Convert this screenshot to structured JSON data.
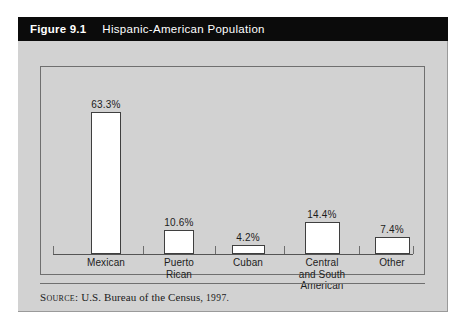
{
  "figure": {
    "number": "Figure 9.1",
    "title": "Hispanic-American Population"
  },
  "source": {
    "label": "Source:",
    "text": "U.S. Bureau of the Census,",
    "year": "1997."
  },
  "colors": {
    "card_background": "#d2d2d2",
    "header_background": "#0b0b0b",
    "header_text": "#ffffff",
    "bar_fill": "#ffffff",
    "bar_border": "#3f3f3f",
    "frame_border": "#6f6f6f",
    "page_background": "#ffffff"
  },
  "chart_data": {
    "type": "bar",
    "title": "Hispanic-American Population",
    "categories": [
      "Mexican",
      "Puerto Rican",
      "Cuban",
      "Central and South American",
      "Other"
    ],
    "category_lines": [
      [
        "Mexican"
      ],
      [
        "Puerto",
        "Rican"
      ],
      [
        "Cuban"
      ],
      [
        "Central",
        "and South",
        "American"
      ],
      [
        "Other"
      ]
    ],
    "values": [
      63.3,
      10.6,
      4.2,
      14.4,
      7.4
    ],
    "value_labels": [
      "63.3%",
      "10.6%",
      "4.2%",
      "14.4%",
      "7.4%"
    ],
    "xlabel": "",
    "ylabel": "",
    "ylim": [
      0,
      70
    ],
    "grid": false,
    "legend": false
  }
}
